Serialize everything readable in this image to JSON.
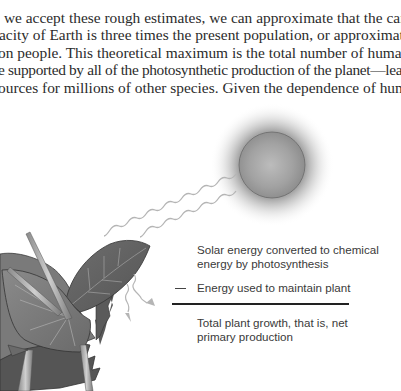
{
  "body_text": {
    "lines": [
      "ing . . . . . . . . . . . . . . . . . . . .",
      "we accept these rough estimates, we can approximate that the carry-",
      "acity of Earth is three times the present population, or approximately",
      "on people. This theoretical maximum is the total number of humans that",
      "e supported by all of the photosynthetic production of the planet—leaving",
      "ources for millions of other species. Given the dependence of humans"
    ]
  },
  "figure": {
    "elements": {
      "sun": "sun-illustration",
      "rays": "wavy-light-rays",
      "plant": "leaf-plant-illustration",
      "arrows_out": "energy-loss-arrows"
    },
    "labels": {
      "solar_line1": "Solar energy converted to chemical",
      "solar_line2": "energy by photosynthesis",
      "maintain_prefix": "—",
      "maintain": "Energy used to maintain plant",
      "total_line1": "Total plant growth, that is, net",
      "total_line2": "primary production"
    },
    "colors": {
      "sun_fill": "#9a9a9a",
      "sun_glow": "#8c8c8c",
      "leaf_dark": "#5a5a5a",
      "leaf_mid": "#7a7a7a",
      "ray": "#b8b8b8",
      "text": "#3a3a3a"
    }
  }
}
